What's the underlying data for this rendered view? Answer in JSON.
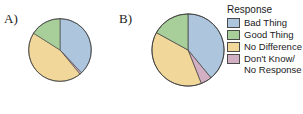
{
  "figure": {
    "panels": [
      {
        "id": "A",
        "label": "A)"
      },
      {
        "id": "B",
        "label": "B)"
      }
    ]
  },
  "legend": {
    "title": "Response",
    "position": "right",
    "items": [
      {
        "label": "Bad Thing",
        "color": "#aec6dd"
      },
      {
        "label": "Good Thing",
        "color": "#a8cf9a"
      },
      {
        "label": "No Difference",
        "color": "#f2d79b"
      },
      {
        "label": "Don't Know/\nNo Response",
        "color": "#d2afc2"
      }
    ]
  },
  "colors": {
    "bad_thing": "#aec6dd",
    "good_thing": "#a8cf9a",
    "no_difference": "#f2d79b",
    "dont_know": "#d2afc2",
    "outline": "#3c3c3c",
    "background": "#ffffff",
    "text": "#1a1a1a"
  },
  "chart_data": [
    {
      "type": "pie",
      "id": "A",
      "title": "A)",
      "xlabel": "",
      "ylabel": "",
      "start_angle": 0,
      "direction": "clockwise",
      "legend": "right",
      "grid": false,
      "categories": [
        "Bad Thing",
        "Don't Know/No Response",
        "No Difference",
        "Good Thing"
      ],
      "values": [
        38,
        1,
        45,
        16
      ],
      "units": "percent",
      "slices": [
        {
          "label": "Bad Thing",
          "value": 38,
          "color": "#aec6dd"
        },
        {
          "label": "Don't Know/No Response",
          "value": 1,
          "color": "#d2afc2"
        },
        {
          "label": "No Difference",
          "value": 45,
          "color": "#f2d79b"
        },
        {
          "label": "Good Thing",
          "value": 16,
          "color": "#a8cf9a"
        }
      ]
    },
    {
      "type": "pie",
      "id": "B",
      "title": "B)",
      "xlabel": "",
      "ylabel": "",
      "start_angle": 0,
      "direction": "clockwise",
      "legend": "right",
      "grid": false,
      "categories": [
        "Bad Thing",
        "Don't Know/No Response",
        "No Difference",
        "Good Thing"
      ],
      "values": [
        39,
        5,
        39,
        17
      ],
      "units": "percent",
      "slices": [
        {
          "label": "Bad Thing",
          "value": 39,
          "color": "#aec6dd"
        },
        {
          "label": "Don't Know/No Response",
          "value": 5,
          "color": "#d2afc2"
        },
        {
          "label": "No Difference",
          "value": 39,
          "color": "#f2d79b"
        },
        {
          "label": "Good Thing",
          "value": 17,
          "color": "#a8cf9a"
        }
      ]
    }
  ]
}
